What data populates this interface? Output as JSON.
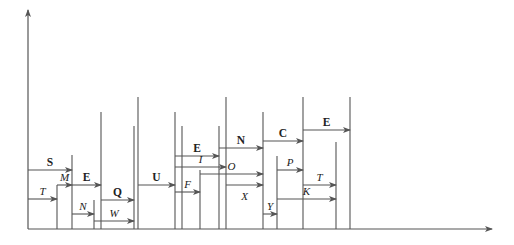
{
  "colors": {
    "line": "#555555",
    "text": "#222222",
    "background": "#ffffff"
  },
  "axes": {
    "origin": [
      28,
      229
    ],
    "y_axis_top": 10,
    "x_axis_end": 492
  },
  "verticals": [
    {
      "x": 57,
      "top": 185
    },
    {
      "x": 72,
      "top": 155
    },
    {
      "x": 94,
      "top": 200
    },
    {
      "x": 101,
      "top": 112
    },
    {
      "x": 134,
      "top": 126
    },
    {
      "x": 138,
      "top": 97
    },
    {
      "x": 175,
      "top": 112
    },
    {
      "x": 182,
      "top": 126
    },
    {
      "x": 200,
      "top": 170
    },
    {
      "x": 219,
      "top": 126
    },
    {
      "x": 226,
      "top": 97
    },
    {
      "x": 263,
      "top": 112
    },
    {
      "x": 277,
      "top": 156
    },
    {
      "x": 303,
      "top": 97
    },
    {
      "x": 336,
      "top": 142
    },
    {
      "x": 350,
      "top": 97
    }
  ],
  "arrows": [
    {
      "label": "S",
      "bold": true,
      "x1": 28,
      "x2": 72,
      "y": 170
    },
    {
      "label": "T",
      "bold": false,
      "x1": 28,
      "x2": 57,
      "y": 199
    },
    {
      "label": "M",
      "bold": false,
      "x1": 57,
      "x2": 72,
      "y": 185
    },
    {
      "label": "E",
      "bold": true,
      "x1": 72,
      "x2": 101,
      "y": 185
    },
    {
      "label": "N",
      "bold": false,
      "x1": 72,
      "x2": 94,
      "y": 214
    },
    {
      "label": "Q",
      "bold": true,
      "x1": 101,
      "x2": 134,
      "y": 200
    },
    {
      "label": "W",
      "bold": false,
      "x1": 94,
      "x2": 134,
      "y": 221
    },
    {
      "label": "U",
      "bold": true,
      "x1": 138,
      "x2": 175,
      "y": 185
    },
    {
      "label": "E",
      "bold": true,
      "x1": 175,
      "x2": 219,
      "y": 156
    },
    {
      "label": "I",
      "bold": false,
      "x1": 175,
      "x2": 226,
      "y": 167
    },
    {
      "label": "F",
      "bold": false,
      "x1": 175,
      "x2": 200,
      "y": 192
    },
    {
      "label": "O",
      "bold": false,
      "x1": 200,
      "x2": 263,
      "y": 174
    },
    {
      "label": "N",
      "bold": true,
      "x1": 219,
      "x2": 263,
      "y": 148
    },
    {
      "label": "X",
      "bold": false,
      "x1": 226,
      "x2": 263,
      "y": 185,
      "label_below": true
    },
    {
      "label": "C",
      "bold": true,
      "x1": 263,
      "x2": 303,
      "y": 141
    },
    {
      "label": "Y",
      "bold": false,
      "x1": 263,
      "x2": 277,
      "y": 214
    },
    {
      "label": "P",
      "bold": false,
      "x1": 277,
      "x2": 303,
      "y": 170
    },
    {
      "label": "K",
      "bold": false,
      "x1": 277,
      "x2": 336,
      "y": 199
    },
    {
      "label": "E",
      "bold": true,
      "x1": 303,
      "x2": 350,
      "y": 130
    },
    {
      "label": "T",
      "bold": false,
      "x1": 303,
      "x2": 336,
      "y": 185
    }
  ]
}
